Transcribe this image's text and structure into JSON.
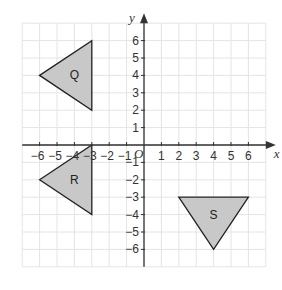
{
  "figure": {
    "type": "coordinate-grid",
    "x_axis_label": "x",
    "y_axis_label": "y",
    "origin_label": "O",
    "x_range": [
      -6,
      6
    ],
    "y_range": [
      -6,
      6
    ],
    "x_ticks": [
      "-6",
      "-5",
      "-4",
      "-3",
      "-2",
      "-1",
      "1",
      "2",
      "3",
      "4",
      "5",
      "6"
    ],
    "y_ticks": [
      "6",
      "5",
      "4",
      "3",
      "2",
      "1",
      "-1",
      "-2",
      "-3",
      "-4",
      "-5",
      "-6"
    ],
    "colors": {
      "grid": "#e4e4e4",
      "axis": "#333333",
      "shape_fill": "#c8c8c8",
      "shape_stroke": "#222222"
    },
    "shapes": [
      {
        "label": "Q",
        "vertices": [
          [
            -6,
            4
          ],
          [
            -3,
            6
          ],
          [
            -3,
            2
          ]
        ]
      },
      {
        "label": "R",
        "vertices": [
          [
            -6,
            -2
          ],
          [
            -3,
            0
          ],
          [
            -3,
            -4
          ]
        ]
      },
      {
        "label": "S",
        "vertices": [
          [
            2,
            -3
          ],
          [
            6,
            -3
          ],
          [
            4,
            -6
          ]
        ]
      }
    ]
  }
}
